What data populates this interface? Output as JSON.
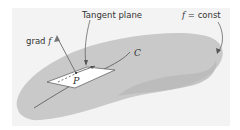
{
  "figure": {
    "labels": {
      "tangent_plane": "Tangent plane",
      "grad_prefix": "grad",
      "grad_f": "f",
      "surface_f": "f",
      "surface_eq": "= const",
      "curve": "C",
      "point": "P"
    },
    "colors": {
      "background": "#f3f3f3",
      "surface": "#c9c9c9",
      "surface_shadow": "#bdbdbd",
      "plane": "#ffffff",
      "lines": "#555555"
    }
  }
}
